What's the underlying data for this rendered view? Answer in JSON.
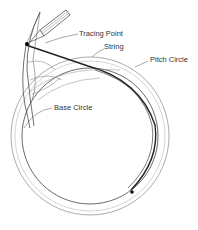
{
  "diagram": {
    "labels": {
      "tracing_point": "Tracing Point",
      "string": "String",
      "pitch_circle": "Pitch Circle",
      "base_circle": "Base Circle"
    },
    "colors": {
      "line": "#222222",
      "thin_line": "#666666",
      "background": "#ffffff"
    }
  }
}
